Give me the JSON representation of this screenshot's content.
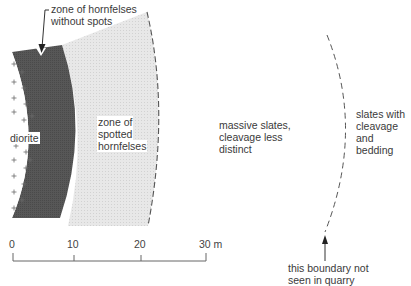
{
  "diagram": {
    "type": "geological cross-section (contact metamorphic aureole)",
    "colors": {
      "diorite_fill": "#ffffff",
      "diorite_cross": "#666666",
      "hornfels_no_spots": "#555555",
      "spotted_hornfels": "#e6e6e6",
      "slates": "#ffffff",
      "boundary_line": "#555555"
    },
    "zones": [
      {
        "id": "diorite",
        "lines": [
          "diorite"
        ]
      },
      {
        "id": "hornfels-without-spots",
        "lines": [
          "zone of hornfelses",
          "without spots"
        ]
      },
      {
        "id": "spotted-hornfels",
        "lines": [
          "zone of",
          "spotted",
          "hornfelses"
        ]
      },
      {
        "id": "massive-slates",
        "lines": [
          "massive slates,",
          "cleavage less",
          "distinct"
        ]
      },
      {
        "id": "slates-cleavage-bedding",
        "lines": [
          "slates with",
          "cleavage",
          "and",
          "bedding"
        ]
      }
    ],
    "annotation": {
      "lines": [
        "this boundary not",
        "seen in quarry"
      ]
    },
    "scale_bar": {
      "ticks": [
        "0",
        "10",
        "20",
        "30 m"
      ],
      "unit": "m"
    }
  }
}
